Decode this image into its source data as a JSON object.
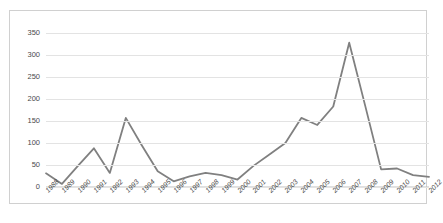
{
  "chart_data": {
    "type": "line",
    "title": "",
    "subtitle": "",
    "xlabel": "",
    "ylabel": "",
    "categories": [
      "1988",
      "1989",
      "1990",
      "1991",
      "1992",
      "1993",
      "1994",
      "1995",
      "1996",
      "1997",
      "1998",
      "1999",
      "2000",
      "2001",
      "2002",
      "2003",
      "2004",
      "2005",
      "2006",
      "2007",
      "2008",
      "2009",
      "2010",
      "2011",
      "2012"
    ],
    "series": [
      {
        "name": "",
        "color": "#808080",
        "values": [
          31,
          7,
          48,
          88,
          32,
          157,
          95,
          36,
          13,
          24,
          32,
          27,
          17,
          48,
          74,
          100,
          157,
          141,
          183,
          328,
          185,
          40,
          42,
          27,
          23
        ]
      }
    ],
    "ylim": [
      0,
      350
    ],
    "ytick_values": [
      0,
      50,
      100,
      150,
      200,
      250,
      300,
      350
    ],
    "ytick_labels": [
      "0",
      "50",
      "100",
      "150",
      "200",
      "250",
      "300",
      "350"
    ],
    "grid": true,
    "grid_axis": "y",
    "legend": false,
    "legend_position": "none",
    "markers": false,
    "xtick_rotation": -45,
    "annotations": []
  },
  "styling": {
    "plot_background": "#ffffff",
    "frame_border": "#d0d0d0",
    "gridline_color": "#e3e3e3",
    "axis_color": "#bfbfbf",
    "tick_label_color": "#4a4a4a"
  }
}
